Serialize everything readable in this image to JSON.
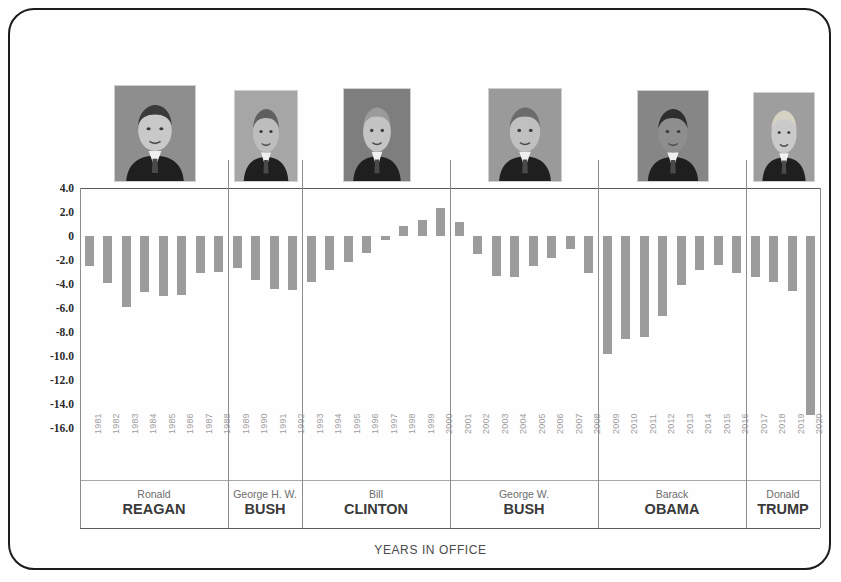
{
  "chart_data": {
    "type": "bar",
    "title": "",
    "xlabel": "YEARS IN OFFICE",
    "ylabel": "",
    "ylim": [
      -16.0,
      4.0
    ],
    "ytick_labels": [
      "4.0",
      "2.0",
      "0",
      "-2.0",
      "-4.0",
      "-6.0",
      "-8.0",
      "-10.0",
      "-12.0",
      "-14.0",
      "-16.0"
    ],
    "ytick_values": [
      4.0,
      2.0,
      0,
      -2.0,
      -4.0,
      -6.0,
      -8.0,
      -10.0,
      -12.0,
      -14.0,
      -16.0
    ],
    "grid": false,
    "legend": "none",
    "bar_color": "#9c9c9c",
    "categories": [
      "1981",
      "1982",
      "1983",
      "1984",
      "1985",
      "1986",
      "1987",
      "1988",
      "1989",
      "1990",
      "1991",
      "1992",
      "1993",
      "1994",
      "1995",
      "1996",
      "1997",
      "1998",
      "1999",
      "2000",
      "2001",
      "2002",
      "2003",
      "2004",
      "2005",
      "2006",
      "2007",
      "2008",
      "2009",
      "2010",
      "2011",
      "2012",
      "2013",
      "2014",
      "2015",
      "2016",
      "2017",
      "2018",
      "2019",
      "2020"
    ],
    "values": [
      -2.5,
      -3.9,
      -5.9,
      -4.7,
      -5.0,
      -4.9,
      -3.1,
      -3.0,
      -2.7,
      -3.7,
      -4.4,
      -4.5,
      -3.8,
      -2.8,
      -2.2,
      -1.4,
      -0.3,
      0.8,
      1.3,
      2.3,
      1.2,
      -1.5,
      -3.3,
      -3.4,
      -2.5,
      -1.8,
      -1.1,
      -3.1,
      -9.8,
      -8.6,
      -8.4,
      -6.7,
      -4.1,
      -2.8,
      -2.4,
      -3.1,
      -3.4,
      -3.8,
      -4.6,
      -14.9
    ]
  },
  "presidents": [
    {
      "first": "Ronald",
      "last": "REAGAN",
      "start_year": "1981",
      "end_year": "1988",
      "photo_label": "ronald-reagan"
    },
    {
      "first": "George H. W.",
      "last": "BUSH",
      "start_year": "1989",
      "end_year": "1992",
      "photo_label": "george-hw-bush"
    },
    {
      "first": "Bill",
      "last": "CLINTON",
      "start_year": "1993",
      "end_year": "2000",
      "photo_label": "bill-clinton"
    },
    {
      "first": "George W.",
      "last": "BUSH",
      "start_year": "2001",
      "end_year": "2008",
      "photo_label": "george-w-bush"
    },
    {
      "first": "Barack",
      "last": "OBAMA",
      "start_year": "2009",
      "end_year": "2016",
      "photo_label": "barack-obama"
    },
    {
      "first": "Donald",
      "last": "TRUMP",
      "start_year": "2017",
      "end_year": "2020",
      "photo_label": "donald-trump"
    }
  ]
}
